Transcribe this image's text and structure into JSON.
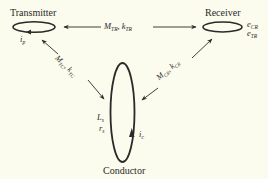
{
  "nodes": {
    "transmitter": {
      "label": "Transmitter",
      "current": {
        "sym": "i",
        "sub": "p"
      }
    },
    "receiver": {
      "label": "Receiver",
      "emfs": [
        {
          "sym": "e",
          "sub": "CR"
        },
        {
          "sym": "e",
          "sub": "TR"
        }
      ]
    },
    "conductor": {
      "label": "Conductor",
      "inductance": {
        "sym": "L",
        "sub": "s"
      },
      "resistance": {
        "sym": "r",
        "sub": "s"
      },
      "current": {
        "sym": "i",
        "sub": "c"
      }
    }
  },
  "links": {
    "transmitter_receiver": {
      "m": "M",
      "m_sub": "TR",
      "sep": ", ",
      "k": "k",
      "k_sub": "TR"
    },
    "transmitter_conductor": {
      "m": "M",
      "m_sub": "TC",
      "sep": ", ",
      "k": "k",
      "k_sub": "TC"
    },
    "conductor_receiver": {
      "m": "M",
      "m_sub": "CR",
      "sep": ", ",
      "k": "k",
      "k_sub": "CR"
    }
  },
  "colors": {
    "background": "#fbfbee",
    "ink": "#2a2a2a"
  }
}
